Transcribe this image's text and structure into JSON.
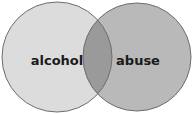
{
  "diagram": {
    "type": "venn",
    "sets": [
      {
        "id": "left",
        "label": "alcohol",
        "fill": "#dcdcdc",
        "stroke": "#6e6e6e"
      },
      {
        "id": "right",
        "label": "abuse",
        "fill": "#b9b9b9",
        "stroke": "#6e6e6e"
      }
    ],
    "intersection": {
      "fill": "#9a9a9a"
    },
    "background": "#ffffff"
  }
}
